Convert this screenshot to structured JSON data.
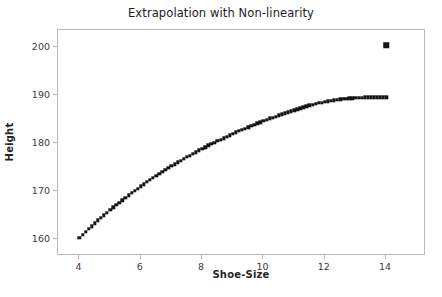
{
  "chart_data": {
    "type": "scatter",
    "title": "Extrapolation with Non-linearity",
    "xlabel": "Shoe-Size",
    "ylabel": "Height",
    "xlim": [
      3.3,
      15.3
    ],
    "ylim": [
      156.5,
      203.5
    ],
    "xticks": [
      4,
      6,
      8,
      10,
      12,
      14
    ],
    "xtick_labels": [
      "4",
      "6",
      "8",
      "10",
      "12",
      "14"
    ],
    "yticks": [
      160,
      170,
      180,
      190,
      200
    ],
    "ytick_labels": [
      "160",
      "170",
      "180",
      "190",
      "200"
    ],
    "grid": false,
    "legend": false,
    "marker": "square",
    "marker_color": "#151515",
    "frame_color": "#b9b9b9",
    "background": "#ffffff",
    "series": [
      {
        "name": "fitted-curve",
        "description": "Dense saturating (logarithmic) curve of predicted height versus shoe size",
        "marker": "square",
        "x": [
          4.0,
          4.1,
          4.2,
          4.3,
          4.4,
          4.5,
          4.6,
          4.7,
          4.8,
          4.9,
          5.0,
          5.1,
          5.2,
          5.3,
          5.4,
          5.5,
          5.6,
          5.7,
          5.8,
          5.9,
          6.0,
          6.1,
          6.2,
          6.3,
          6.4,
          6.5,
          6.6,
          6.7,
          6.8,
          6.9,
          7.0,
          7.1,
          7.2,
          7.3,
          7.4,
          7.5,
          7.6,
          7.7,
          7.8,
          7.9,
          8.0,
          8.1,
          8.2,
          8.3,
          8.4,
          8.5,
          8.6,
          8.7,
          8.8,
          8.9,
          9.0,
          9.1,
          9.2,
          9.3,
          9.4,
          9.5,
          9.6,
          9.7,
          9.8,
          9.9,
          10.0,
          10.1,
          10.2,
          10.3,
          10.4,
          10.5,
          10.6,
          10.7,
          10.8,
          10.9,
          11.0,
          11.1,
          11.2,
          11.3,
          11.4,
          11.5,
          11.6,
          11.7,
          11.8,
          11.9,
          12.0,
          12.1,
          12.2,
          12.3,
          12.4,
          12.5,
          12.6,
          12.7,
          12.8,
          12.9,
          13.0,
          13.1,
          13.2,
          13.3,
          13.4,
          13.5,
          13.6,
          13.7,
          13.8,
          13.9,
          14.0
        ],
        "y": [
          160.3,
          160.9,
          161.5,
          162.1,
          162.7,
          163.3,
          163.9,
          164.4,
          165.0,
          165.5,
          166.1,
          166.6,
          167.1,
          167.6,
          168.1,
          168.6,
          169.1,
          169.6,
          170.1,
          170.5,
          171.0,
          171.4,
          171.9,
          172.3,
          172.7,
          173.2,
          173.6,
          174.0,
          174.4,
          174.8,
          175.2,
          175.6,
          176.0,
          176.3,
          176.7,
          177.1,
          177.4,
          177.8,
          178.1,
          178.5,
          178.8,
          179.1,
          179.5,
          179.8,
          180.1,
          180.4,
          180.7,
          181.0,
          181.3,
          181.6,
          181.9,
          182.2,
          182.5,
          182.8,
          183.0,
          183.3,
          183.6,
          183.8,
          184.1,
          184.3,
          184.6,
          184.8,
          185.1,
          185.3,
          185.5,
          185.8,
          186.0,
          186.2,
          186.4,
          186.6,
          186.8,
          187.0,
          187.2,
          187.4,
          187.6,
          187.8,
          187.9,
          188.1,
          188.3,
          188.4,
          188.6,
          188.7,
          188.8,
          188.9,
          189.0,
          189.1,
          189.2,
          189.2,
          189.3,
          189.3,
          189.4,
          189.4,
          189.4,
          189.5,
          189.5,
          189.5,
          189.5,
          189.5,
          189.5,
          189.5,
          189.5
        ]
      },
      {
        "name": "outlier-point",
        "description": "Single isolated observation far above the fitted curve",
        "marker": "square",
        "x": [
          14.0
        ],
        "y": [
          200.3
        ]
      }
    ]
  },
  "figure": {
    "title": "Extrapolation with Non-linearity",
    "xlabel": "Shoe-Size",
    "ylabel": "Height"
  }
}
